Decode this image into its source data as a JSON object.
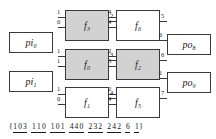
{
  "diagram": {
    "colors": {
      "active_node_fill": "#d2d2d2",
      "inactive_node_fill": "#ffffff",
      "stroke": "#3a3a3a",
      "text": "#1a1a1a",
      "background": "#ffffff"
    },
    "program_inputs": [
      {
        "id": "pi0",
        "label": "pi",
        "sub": "0",
        "active": false
      },
      {
        "id": "pi1",
        "label": "pi",
        "sub": "1",
        "active": false
      }
    ],
    "function_nodes": [
      {
        "id": "f3",
        "label": "f",
        "sub": "3",
        "active": true,
        "inputs": [
          "1",
          "0"
        ],
        "output": "2"
      },
      {
        "id": "f0",
        "label": "f",
        "sub": "0",
        "active": true,
        "inputs": [
          "1",
          "1"
        ],
        "output": "3"
      },
      {
        "id": "f1",
        "label": "f",
        "sub": "1",
        "active": false,
        "inputs": [
          "1",
          "0"
        ],
        "output": "4"
      },
      {
        "id": "f6",
        "label": "f",
        "sub": "6",
        "active": false,
        "inputs": [
          "4",
          "4"
        ],
        "output": "5"
      },
      {
        "id": "f2",
        "label": "f",
        "sub": "2",
        "active": true,
        "inputs": [
          "2",
          "3"
        ],
        "output": "6"
      },
      {
        "id": "f5",
        "label": "f",
        "sub": "5",
        "active": false,
        "inputs": [
          "2",
          "4"
        ],
        "output": "7"
      }
    ],
    "program_outputs": [
      {
        "id": "po8",
        "label": "po",
        "sub": "8",
        "active": false,
        "input": "6"
      },
      {
        "id": "po9",
        "label": "po",
        "sub": "9",
        "active": false,
        "input": "1"
      }
    ],
    "genotype": {
      "open_brace": "{",
      "close_brace": "}",
      "groups": [
        {
          "digits": [
            "1",
            "0",
            "3"
          ]
        },
        {
          "digits": [
            "1",
            "1",
            "0"
          ]
        },
        {
          "digits": [
            "1",
            "0",
            "1"
          ]
        },
        {
          "digits": [
            "4",
            "4",
            "0"
          ]
        },
        {
          "digits": [
            "2",
            "3",
            "2"
          ]
        },
        {
          "digits": [
            "2",
            "4",
            "2"
          ]
        },
        {
          "digits": [
            "6"
          ]
        },
        {
          "digits": [
            "1"
          ]
        }
      ]
    }
  }
}
